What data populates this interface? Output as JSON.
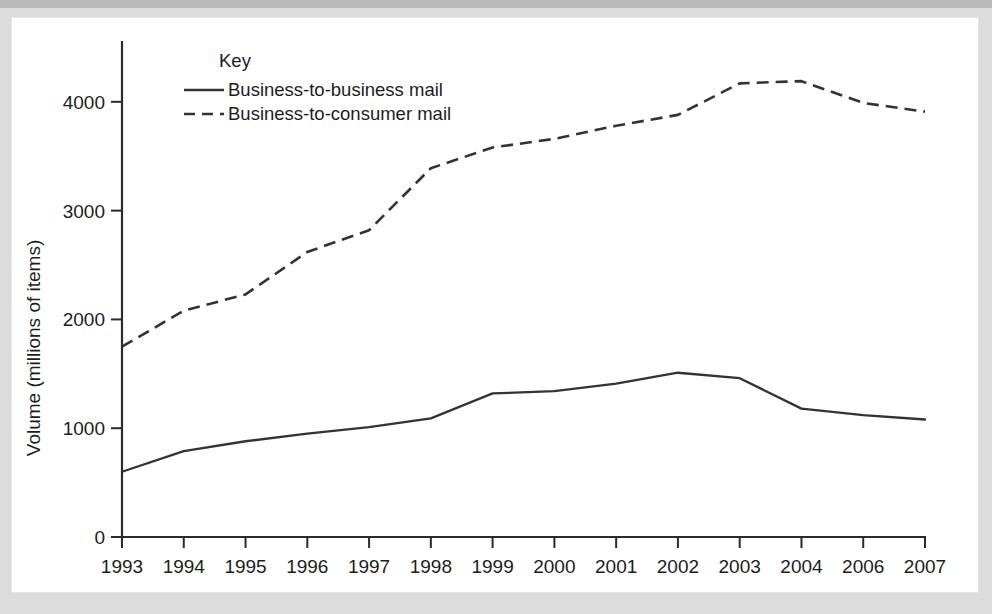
{
  "chart_data": {
    "type": "line",
    "title": "",
    "xlabel": "",
    "ylabel": "Volume (millions of items)",
    "categories": [
      "1993",
      "1994",
      "1995",
      "1996",
      "1997",
      "1998",
      "1999",
      "2000",
      "2001",
      "2002",
      "2003",
      "2004",
      "2006",
      "2007"
    ],
    "x_tick_labels": [
      "1993",
      "1994",
      "1995",
      "1996",
      "1997",
      "1998",
      "1999",
      "2000",
      "2001",
      "2002",
      "2003",
      "2004",
      "2006",
      "2007"
    ],
    "y_tick_labels": [
      "0",
      "1000",
      "2000",
      "3000",
      "4000"
    ],
    "y_ticks": [
      0,
      1000,
      2000,
      3000,
      4000
    ],
    "ylim": [
      0,
      4550
    ],
    "grid": false,
    "legend_position": "top-center-inside",
    "legend_title": "Key",
    "series": [
      {
        "name": "Business-to-business mail",
        "style": "solid",
        "color": "#333333",
        "values": [
          600,
          790,
          880,
          950,
          1010,
          1090,
          1320,
          1340,
          1410,
          1510,
          1460,
          1180,
          1120,
          1080
        ]
      },
      {
        "name": "Business-to-consumer mail",
        "style": "dashed",
        "color": "#333333",
        "values": [
          1750,
          2080,
          2230,
          2620,
          2820,
          3390,
          3580,
          3660,
          3780,
          3880,
          4170,
          4190,
          3990,
          3910
        ]
      }
    ]
  },
  "legend": {
    "title": "Key",
    "entries": [
      {
        "label": "Business-to-business mail",
        "style": "solid"
      },
      {
        "label": "Business-to-consumer mail",
        "style": "dashed"
      }
    ]
  },
  "axes": {
    "y_title": "Volume (millions of items)"
  }
}
